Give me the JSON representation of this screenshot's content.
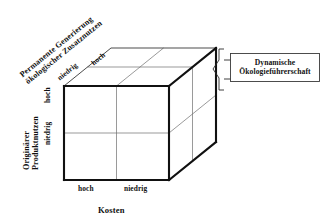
{
  "diagram": {
    "type": "3d-cube-matrix",
    "axes": {
      "x": {
        "name": "x-axis",
        "title": "Kosten",
        "ticks": [
          "hoch",
          "niedrig"
        ]
      },
      "y": {
        "name": "y-axis",
        "title_line1": "Originärer",
        "title_line2": "Produktnutzen",
        "title": "Originärer Produktnutzen",
        "ticks": [
          "hoch",
          "niedrig"
        ]
      },
      "z": {
        "name": "depth-axis",
        "title_line1": "Permanente Generierung",
        "title_line2": "ökologischer Zusatznutzen",
        "title": "Permanente Generierung ökologischer Zusatznutzen",
        "ticks": [
          "niedrig",
          "hoch"
        ]
      }
    },
    "callout": {
      "line1": "Dynamische",
      "line2": "Ökologieführerschaft"
    },
    "colors": {
      "edge": "#111111",
      "grid": "#6e6e6e",
      "face": "#ffffff",
      "callout_border": "#3a3a3a",
      "text": "#111111",
      "background": "#ffffff"
    }
  }
}
